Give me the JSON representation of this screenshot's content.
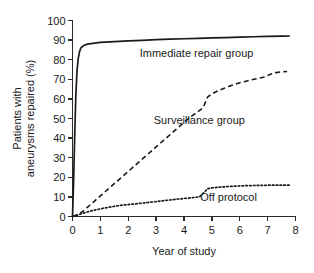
{
  "chart_data": {
    "type": "line",
    "title": "",
    "xlabel": "Year of study",
    "ylabel": "Patients with aneurysms repaired (%)",
    "ylabel_lines": [
      "Patients with",
      "aneurysms repaired (%)"
    ],
    "xlim": [
      0,
      8
    ],
    "ylim": [
      0,
      100
    ],
    "xticks": [
      0,
      1,
      2,
      3,
      4,
      5,
      6,
      7,
      8
    ],
    "xtick_labels": [
      "0",
      "1",
      "2",
      "3",
      "4",
      "5",
      "6",
      "7",
      "8"
    ],
    "yticks": [
      0,
      10,
      20,
      30,
      40,
      50,
      60,
      70,
      80,
      90,
      100
    ],
    "ytick_labels": [
      "0",
      "10",
      "20",
      "30",
      "40",
      "50",
      "60",
      "70",
      "80",
      "90",
      "100"
    ],
    "grid": false,
    "legend_position": "inline-annotations",
    "series": [
      {
        "name": "Immediate repair group",
        "style": "solid",
        "color": "#1a1a1a",
        "label_x": 4.45,
        "label_y": 81.5,
        "x": [
          0,
          0.04,
          0.08,
          0.12,
          0.16,
          0.2,
          0.25,
          0.3,
          0.4,
          0.5,
          0.6,
          0.8,
          1.0,
          1.5,
          2.0,
          2.5,
          3.0,
          3.5,
          4.0,
          4.5,
          5.0,
          5.5,
          6.0,
          6.5,
          7.0,
          7.5,
          7.8
        ],
        "y": [
          0,
          18,
          42,
          62,
          74,
          80,
          84,
          86,
          87.2,
          87.8,
          88.1,
          88.5,
          88.8,
          89.2,
          89.6,
          89.9,
          90.2,
          90.5,
          90.7,
          90.9,
          91.1,
          91.3,
          91.5,
          91.7,
          91.9,
          92.0,
          92.1
        ]
      },
      {
        "name": "Surveillance group",
        "style": "dashed",
        "color": "#1a1a1a",
        "label_x": 4.55,
        "label_y": 47.0,
        "x": [
          0,
          0.1,
          0.2,
          0.3,
          0.4,
          0.5,
          0.6,
          0.8,
          1.0,
          1.2,
          1.4,
          1.6,
          1.8,
          2.0,
          2.2,
          2.4,
          2.6,
          2.8,
          3.0,
          3.2,
          3.4,
          3.6,
          3.8,
          4.0,
          4.2,
          4.4,
          4.6,
          4.7,
          4.85,
          5.0,
          5.2,
          5.4,
          5.6,
          5.8,
          6.0,
          6.3,
          6.6,
          6.9,
          7.1,
          7.3,
          7.5,
          7.7
        ],
        "y": [
          0,
          0.5,
          1.2,
          2.0,
          3.0,
          4.2,
          5.5,
          8.0,
          10.5,
          13.0,
          15.5,
          18.0,
          20.5,
          23.0,
          25.5,
          28.0,
          30.5,
          33.0,
          35.5,
          38.0,
          40.5,
          43.0,
          45.5,
          48.0,
          50.5,
          52.5,
          54.5,
          56.0,
          61.0,
          62.5,
          64.0,
          65.2,
          66.3,
          67.3,
          68.2,
          69.3,
          70.3,
          71.2,
          72.6,
          73.4,
          73.8,
          74.0
        ]
      },
      {
        "name": "Off protocol",
        "style": "dotted",
        "color": "#1a1a1a",
        "label_x": 5.6,
        "label_y": 8.0,
        "x": [
          0,
          0.15,
          0.3,
          0.5,
          0.7,
          0.9,
          1.1,
          1.3,
          1.5,
          1.8,
          2.0,
          2.3,
          2.6,
          3.0,
          3.3,
          3.6,
          4.0,
          4.3,
          4.55,
          4.7,
          4.85,
          5.0,
          5.3,
          5.6,
          6.0,
          6.4,
          6.8,
          7.2,
          7.6,
          7.8
        ],
        "y": [
          0,
          0.6,
          1.3,
          2.2,
          3.0,
          3.6,
          4.2,
          4.7,
          5.2,
          5.8,
          6.1,
          6.5,
          7.0,
          7.6,
          8.1,
          8.6,
          9.2,
          9.6,
          10.0,
          12.0,
          14.2,
          14.6,
          15.0,
          15.3,
          15.6,
          15.8,
          15.9,
          16.0,
          16.0,
          16.0
        ]
      }
    ]
  }
}
